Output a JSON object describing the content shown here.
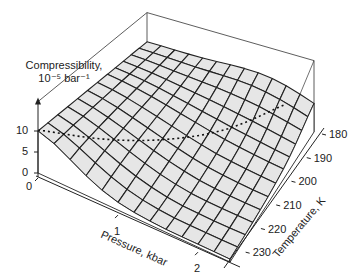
{
  "chart_data": {
    "type": "surface3d",
    "title": "",
    "zlabel": "Compressibility,",
    "zlabel_units": "10⁻⁵ bar⁻¹",
    "xlabel": "Pressure, kbar",
    "ylabel": "Temperature, K",
    "x_ticks": [
      {
        "value": 0,
        "label": "0"
      },
      {
        "value": 1,
        "label": "1"
      },
      {
        "value": 2,
        "label": "2"
      }
    ],
    "y_ticks": [
      {
        "value": 180,
        "label": "180"
      },
      {
        "value": 190,
        "label": "190"
      },
      {
        "value": 200,
        "label": "200"
      },
      {
        "value": 210,
        "label": "210"
      },
      {
        "value": 220,
        "label": "220"
      },
      {
        "value": 230,
        "label": "230"
      }
    ],
    "z_ticks": [
      {
        "value": 0,
        "label": "0"
      },
      {
        "value": 5,
        "label": "5"
      },
      {
        "value": 10,
        "label": "10"
      }
    ],
    "xlim": [
      0,
      2.4
    ],
    "ylim": [
      180,
      235
    ],
    "zlim": [
      0,
      17
    ],
    "grid_x": [
      0,
      0.2,
      0.4,
      0.6,
      0.8,
      1.0,
      1.2,
      1.4,
      1.6,
      1.8,
      2.0,
      2.2,
      2.4
    ],
    "grid_y": [
      180,
      184,
      188,
      192,
      196,
      200,
      205,
      210,
      215,
      220,
      225,
      230,
      235
    ],
    "surface_description": "Compressibility surface: ~10 near 0 kbar across temperatures, rising toward low temperature (180 K) and decreasing toward high pressure; ridge/peak near 180 K at ~2 kbar, falling to near 0 at high pressure and high temperature.",
    "dotted_line": {
      "description": "Dotted line along the surface at constant compressibility ~10 from front-left to back-right",
      "z": 10
    },
    "surface_fill": "#e6e6e6",
    "line_color": "#222222"
  }
}
